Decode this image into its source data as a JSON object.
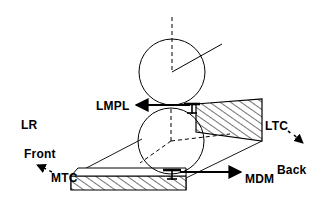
{
  "figure": {
    "background_color": "#ffffff",
    "stroke_color": "#000000",
    "width": 330,
    "height": 218
  },
  "labels": {
    "lmpl": "LMPL",
    "ltc": "LTC",
    "mtc": "MTC",
    "mdm": "MDM",
    "lr": "LR",
    "front": "Front",
    "back": "Back"
  },
  "shapes": {
    "upper_sphere": {
      "name": "upper-condyle-circle",
      "cx": 172,
      "cy": 72,
      "r": 33
    },
    "lower_sphere": {
      "name": "lower-condyle-circle",
      "cx": 171,
      "cy": 141,
      "r": 33
    },
    "upper_slab": {
      "name": "ltc-hatched-slab",
      "hatch": "diagonal",
      "fill": "#ffffff"
    },
    "lower_slab": {
      "name": "mtc-hatched-slab",
      "hatch": "diagonal",
      "fill": "#ffffff"
    }
  },
  "annotations": {
    "lmpl_arrow": {
      "direction": "left",
      "from_x": 196,
      "from_y": 106,
      "to_x": 138,
      "to_y": 106
    },
    "mdm_arrow": {
      "direction": "right",
      "from_x": 186,
      "from_y": 176,
      "to_x": 243,
      "to_y": 176
    },
    "front_arrow": {
      "direction": "down-left",
      "style": "dashed"
    },
    "back_arrow": {
      "direction": "down-right",
      "style": "dashed"
    },
    "vertical_axis": {
      "style": "dashed",
      "from_y": 18,
      "to_y": 72
    },
    "radius_line": {
      "style": "solid",
      "angle": "up-right"
    }
  }
}
